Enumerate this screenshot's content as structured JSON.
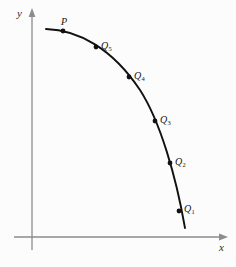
{
  "figure": {
    "title": "",
    "background_color": "#fcfcfc",
    "width": 236,
    "height": 267
  },
  "axes": {
    "x_label": "x",
    "y_label": "y",
    "axis_color": "#8c8c8c",
    "origin": {
      "x": 32,
      "y": 237
    },
    "x_axis": {
      "start_x": 14,
      "end_x": 222,
      "y": 237,
      "arrow": "right"
    },
    "y_axis": {
      "x": 32,
      "start_y": 250,
      "end_y": 14,
      "arrow": "up"
    }
  },
  "curve": {
    "color": "#111111",
    "stroke_width": 1.9,
    "description": "concave-down decreasing arc",
    "path": "M 46,29 C 78,30 112,48 140,90 C 160,121 176,176 185,228"
  },
  "points": [
    {
      "id": "P",
      "label": "P",
      "subscript": "",
      "x": 63,
      "y": 31,
      "label_x": 61,
      "label_y": 17
    },
    {
      "id": "Q5",
      "label": "Q",
      "subscript": "5",
      "x": 96,
      "y": 47,
      "label_x": 101,
      "label_y": 41
    },
    {
      "id": "Q4",
      "label": "Q",
      "subscript": "4",
      "x": 129,
      "y": 77,
      "label_x": 134,
      "label_y": 71
    },
    {
      "id": "Q3",
      "label": "Q",
      "subscript": "3",
      "x": 155,
      "y": 121,
      "label_x": 160,
      "label_y": 115
    },
    {
      "id": "Q2",
      "label": "Q",
      "subscript": "2",
      "x": 170,
      "y": 163,
      "label_x": 175,
      "label_y": 157
    },
    {
      "id": "Q1",
      "label": "Q",
      "subscript": "1",
      "x": 179,
      "y": 211,
      "label_x": 184,
      "label_y": 204
    }
  ],
  "point_style": {
    "dot_color": "#111111",
    "dot_radius": 2.4
  }
}
